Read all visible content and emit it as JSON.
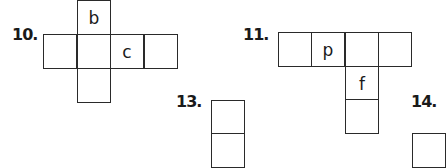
{
  "problems": [
    {
      "number": "10.",
      "cells": [
        {
          "row": 0,
          "col": 1,
          "label": "b"
        },
        {
          "row": 1,
          "col": 0,
          "label": ""
        },
        {
          "row": 1,
          "col": 1,
          "label": ""
        },
        {
          "row": 1,
          "col": 2,
          "label": "c"
        },
        {
          "row": 1,
          "col": 3,
          "label": ""
        },
        {
          "row": 2,
          "col": 1,
          "label": ""
        }
      ]
    },
    {
      "number": "11.",
      "cells": [
        {
          "row": 0,
          "col": 0,
          "label": ""
        },
        {
          "row": 0,
          "col": 1,
          "label": "p"
        },
        {
          "row": 0,
          "col": 2,
          "label": ""
        },
        {
          "row": 0,
          "col": 3,
          "label": ""
        },
        {
          "row": 1,
          "col": 2,
          "label": "f"
        },
        {
          "row": 2,
          "col": 2,
          "label": ""
        }
      ]
    },
    {
      "number": "13.",
      "cells": [
        {
          "row": 0,
          "col": 0,
          "label": ""
        },
        {
          "row": 1,
          "col": 0,
          "label": ""
        }
      ]
    },
    {
      "number": "14.",
      "cells": [
        {
          "row": 0,
          "col": 0,
          "label": ""
        }
      ]
    }
  ]
}
